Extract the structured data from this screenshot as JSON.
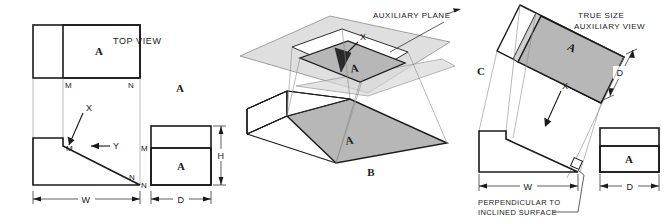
{
  "figure": {
    "colors": {
      "line": "#1a1a1a",
      "light_gray_fill": "#cfcfcf",
      "mid_gray_fill": "#bdbdbd",
      "dark_gray_fill": "#b0b0b0",
      "plane_gray_fill": "#d9d9d9",
      "construction_line": "#8a8a8a",
      "background": "#ffffff"
    }
  },
  "panel_a": {
    "key": "A",
    "panel_label": "A",
    "view_title": "TOP VIEW",
    "surface_label_top": "A",
    "surface_label_side": "A",
    "corner_labels": {
      "top_m": "M",
      "top_n": "N",
      "front_m": "M",
      "front_n": "N",
      "side_m": "M",
      "side_n": "N"
    },
    "direction_arrows": [
      {
        "name": "x-arrow",
        "label": "X"
      },
      {
        "name": "y-arrow",
        "label": "Y"
      }
    ],
    "dimensions": [
      {
        "name": "width-dimension",
        "label": "W"
      },
      {
        "name": "depth-dimension",
        "label": "D"
      },
      {
        "name": "height-dimension",
        "label": "H"
      }
    ]
  },
  "panel_b": {
    "key": "B",
    "panel_label": "B",
    "callout": "AUXILIARY PLANE",
    "arrow_label": "X",
    "surface_label_projected": "A",
    "surface_label_object": "A"
  },
  "panel_c": {
    "key": "C",
    "panel_label": "C",
    "view_title_line1": "TRUE SIZE",
    "view_title_line2": "AUXILIARY VIEW",
    "note_line1": "PERPENDICULAR TO",
    "note_line2": "INCLINED SURFACE",
    "arrow_label": "X",
    "surface_label_aux": "A",
    "surface_label_side": "A",
    "dimensions": [
      {
        "name": "depth-dimension-aux",
        "label": "D"
      },
      {
        "name": "width-dimension",
        "label": "W"
      },
      {
        "name": "depth-dimension-side",
        "label": "D"
      }
    ]
  }
}
